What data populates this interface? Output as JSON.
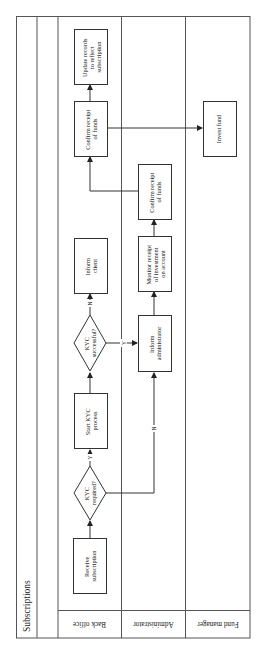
{
  "diagram": {
    "title": "Subscriptions",
    "orientation": "rotated-90-ccw",
    "lanes": [
      {
        "id": "back_office",
        "label": "Back office"
      },
      {
        "id": "administrator",
        "label": "Administrator"
      },
      {
        "id": "fund_manager",
        "label": "Fund manager"
      }
    ],
    "nodes": {
      "receive": {
        "lines": [
          "Receive",
          "subscription"
        ],
        "lane": "back_office",
        "shape": "rect"
      },
      "kyc_required": {
        "lines": [
          "KYC",
          "required?"
        ],
        "lane": "back_office",
        "shape": "diamond"
      },
      "start_kyc": {
        "lines": [
          "Start KYC",
          "process"
        ],
        "lane": "back_office",
        "shape": "rect"
      },
      "kyc_successful": {
        "lines": [
          "KYC",
          "successful?"
        ],
        "lane": "back_office",
        "shape": "diamond"
      },
      "inform_client": {
        "lines": [
          "Inform",
          "client"
        ],
        "lane": "back_office",
        "shape": "rect"
      },
      "confirm_bo": {
        "lines": [
          "Confirm receipt",
          "of funds"
        ],
        "lane": "back_office",
        "shape": "rect"
      },
      "update_records": {
        "lines": [
          "Update records",
          "to reflect",
          "subscription"
        ],
        "lane": "back_office",
        "shape": "rect"
      },
      "inform_admin": {
        "lines": [
          "Inform",
          "administrator"
        ],
        "lane": "administrator",
        "shape": "rect"
      },
      "monitor": {
        "lines": [
          "Monitor receipt",
          "of investment",
          "on account"
        ],
        "lane": "administrator",
        "shape": "rect"
      },
      "confirm_admin": {
        "lines": [
          "Confirm receipt",
          "of funds"
        ],
        "lane": "administrator",
        "shape": "rect"
      },
      "invest_fund": {
        "lines": [
          "Invest fund"
        ],
        "lane": "fund_manager",
        "shape": "rect"
      }
    },
    "edges": [
      {
        "from": "receive",
        "to": "kyc_required",
        "label": ""
      },
      {
        "from": "kyc_required",
        "to": "start_kyc",
        "label": "Y"
      },
      {
        "from": "kyc_required",
        "to": "inform_admin",
        "label": "N"
      },
      {
        "from": "start_kyc",
        "to": "kyc_successful",
        "label": ""
      },
      {
        "from": "kyc_successful",
        "to": "inform_client",
        "label": "N"
      },
      {
        "from": "kyc_successful",
        "to": "inform_admin",
        "label": "Y"
      },
      {
        "from": "inform_admin",
        "to": "monitor",
        "label": ""
      },
      {
        "from": "monitor",
        "to": "confirm_admin",
        "label": ""
      },
      {
        "from": "confirm_admin",
        "to": "confirm_bo",
        "label": ""
      },
      {
        "from": "confirm_bo",
        "to": "update_records",
        "label": ""
      },
      {
        "from": "confirm_bo",
        "to": "invest_fund",
        "label": ""
      }
    ],
    "edge_labels": {
      "yes": "Y",
      "no": "N"
    }
  }
}
